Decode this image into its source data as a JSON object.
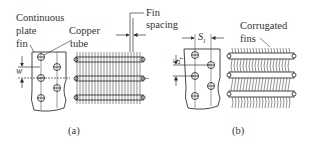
{
  "figure": {
    "panel_a": {
      "caption": "(a)",
      "labels": {
        "continuous_1": "Continuous",
        "continuous_2": "plate",
        "continuous_3": "fin",
        "copper_1": "Copper",
        "copper_2": "tube",
        "fin_spacing_1": "Fin",
        "fin_spacing_2": "spacing",
        "dim_w": "w"
      }
    },
    "panel_b": {
      "caption": "(b)",
      "labels": {
        "corrugated_1": "Corrugated",
        "corrugated_2": "fins",
        "dim_sl": "S",
        "dim_sl_sub": "l",
        "dim_st": "S",
        "dim_st_sub": "t"
      }
    },
    "colors": {
      "line": "#333333",
      "background": "#ffffff"
    }
  }
}
